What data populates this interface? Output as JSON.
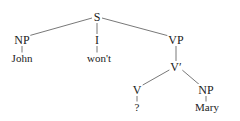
{
  "diagram": {
    "type": "syntax-tree",
    "nodes": {
      "S": {
        "label": "S",
        "x": 97,
        "y": 17
      },
      "NP1": {
        "label": "NP",
        "x": 22,
        "y": 40
      },
      "I": {
        "label": "I",
        "x": 97,
        "y": 40
      },
      "VP": {
        "label": "VP",
        "x": 176,
        "y": 40
      },
      "John": {
        "label": "John",
        "x": 22,
        "y": 58
      },
      "wont": {
        "label": "won't",
        "x": 99,
        "y": 58
      },
      "Vbar": {
        "label": "V′",
        "x": 176,
        "y": 67
      },
      "V": {
        "label": "V",
        "x": 137,
        "y": 90
      },
      "NP2": {
        "label": "NP",
        "x": 206,
        "y": 90
      },
      "q": {
        "label": "?",
        "x": 137,
        "y": 107
      },
      "Mary": {
        "label": "Mary",
        "x": 207,
        "y": 107
      }
    },
    "edges": [
      [
        "S",
        "NP1"
      ],
      [
        "S",
        "I"
      ],
      [
        "S",
        "VP"
      ],
      [
        "NP1",
        "John"
      ],
      [
        "I",
        "wont"
      ],
      [
        "VP",
        "Vbar"
      ],
      [
        "Vbar",
        "V"
      ],
      [
        "Vbar",
        "NP2"
      ],
      [
        "V",
        "q"
      ],
      [
        "NP2",
        "Mary"
      ]
    ]
  }
}
